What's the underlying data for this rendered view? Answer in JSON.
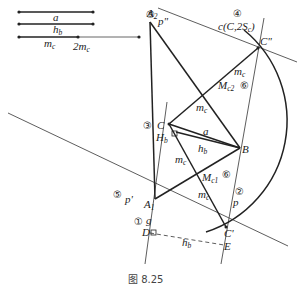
{
  "figure": {
    "caption": "图 8.25",
    "given_segments": [
      {
        "label": "a",
        "y": 12
      },
      {
        "label": "h_b",
        "y": 24
      },
      {
        "label": "m_c",
        "label2": "2m_c",
        "y": 37
      }
    ],
    "points": {
      "A2": {
        "label": "A",
        "sub": "2"
      },
      "C2": {
        "label": "C\""
      },
      "C": {
        "label": "C",
        "marker": "③"
      },
      "Hb": {
        "label": "H",
        "sub": "b"
      },
      "B": {
        "label": "B"
      },
      "A1": {
        "label": "A",
        "sub": "1"
      },
      "C1": {
        "label": "C'"
      },
      "D": {
        "label": "D"
      },
      "E": {
        "label": "E"
      },
      "Mc1": {
        "label": "M",
        "sub": "c1",
        "marker": "⑥"
      },
      "Mc2": {
        "label": "M",
        "sub": "c2",
        "marker": "⑥"
      }
    },
    "lines": {
      "p_double": {
        "label": "p\"",
        "marker": "⑤"
      },
      "p_single": {
        "label": "p'",
        "marker": "⑤"
      },
      "g": {
        "label": "g",
        "marker": "①"
      },
      "p": {
        "label": "p",
        "marker": "②"
      }
    },
    "circle": {
      "label": "c(C,2S",
      "sub": "c",
      "close": ")",
      "marker": "④"
    },
    "segment_labels": {
      "a": "a",
      "hb": "h",
      "hb_sub": "b",
      "mc": "m",
      "mc_sub": "c"
    }
  }
}
